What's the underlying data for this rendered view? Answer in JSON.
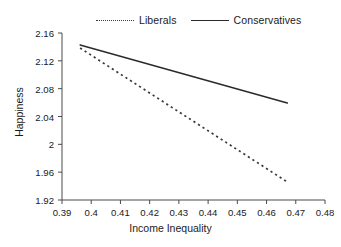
{
  "chart_data": {
    "type": "line",
    "title": "",
    "xlabel": "Income Inequality",
    "ylabel": "Happiness",
    "xlim": [
      0.39,
      0.48
    ],
    "ylim": [
      1.92,
      2.16
    ],
    "xticks": [
      0.39,
      0.4,
      0.41,
      0.42,
      0.43,
      0.44,
      0.45,
      0.46,
      0.47,
      0.48
    ],
    "xtick_labels": [
      "0.39",
      "0.4",
      "0.41",
      "0.42",
      "0.43",
      "0.44",
      "0.45",
      "0.46",
      "0.47",
      "0.48"
    ],
    "yticks": [
      1.92,
      1.96,
      2.0,
      2.04,
      2.08,
      2.12,
      2.16
    ],
    "ytick_labels": [
      "1.92",
      "1.96",
      "2",
      "2.04",
      "2.08",
      "2.12",
      "2.16"
    ],
    "grid": false,
    "legend_position": "above-plot",
    "series": [
      {
        "name": "Liberals",
        "style": "dotted",
        "color": "#3a3a3a",
        "x": [
          0.3962,
          0.4671
        ],
        "values": [
          2.1384,
          1.9459
        ]
      },
      {
        "name": "Conservatives",
        "style": "solid",
        "color": "#2a2a2a",
        "x": [
          0.3962,
          0.4671
        ],
        "values": [
          2.1427,
          2.0593
        ]
      }
    ]
  },
  "legend": {
    "entries": [
      {
        "label": "Liberals",
        "style": "dotted"
      },
      {
        "label": "Conservatives",
        "style": "solid"
      }
    ]
  },
  "axes": {
    "x_title": "Income Inequality",
    "y_title": "Happiness"
  }
}
